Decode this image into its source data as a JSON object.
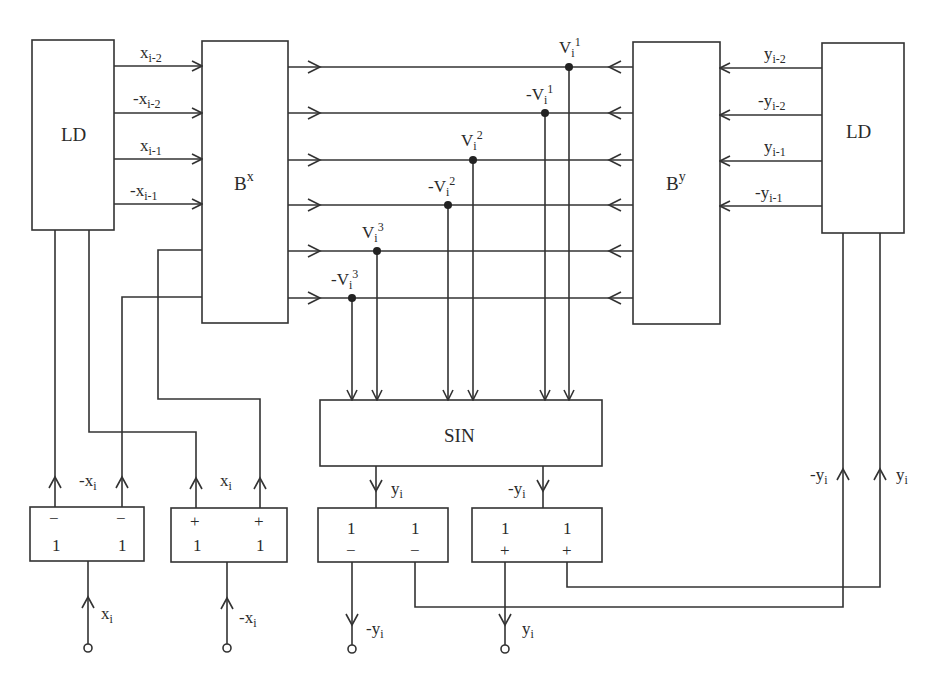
{
  "diagram": {
    "blocks": {
      "ld_left": "LD",
      "ld_right": "LD",
      "bx_base": "B",
      "bx_sup": "x",
      "by_base": "B",
      "by_sup": "y",
      "sin": "SIN"
    },
    "left_inputs": [
      {
        "sign": "",
        "var": "x",
        "sub": "i-2"
      },
      {
        "sign": "-",
        "var": "x",
        "sub": "i-2"
      },
      {
        "sign": "",
        "var": "x",
        "sub": "i-1"
      },
      {
        "sign": "-",
        "var": "x",
        "sub": "i-1"
      }
    ],
    "right_inputs": [
      {
        "sign": "",
        "var": "y",
        "sub": "i-2"
      },
      {
        "sign": "-",
        "var": "y",
        "sub": "i-2"
      },
      {
        "sign": "",
        "var": "y",
        "sub": "i-1"
      },
      {
        "sign": "-",
        "var": "y",
        "sub": "i-1"
      }
    ],
    "taps": [
      {
        "sign": "",
        "var": "V",
        "sub": "i",
        "sup": "1"
      },
      {
        "sign": "-",
        "var": "V",
        "sub": "i",
        "sup": "1"
      },
      {
        "sign": "",
        "var": "V",
        "sub": "i",
        "sup": "2"
      },
      {
        "sign": "-",
        "var": "V",
        "sub": "i",
        "sup": "2"
      },
      {
        "sign": "",
        "var": "V",
        "sub": "i",
        "sup": "3"
      },
      {
        "sign": "-",
        "var": "V",
        "sub": "i",
        "sup": "3"
      }
    ],
    "box1": {
      "top_left": "−",
      "top_right": "−",
      "bot_left": "1",
      "bot_right": "1"
    },
    "box2": {
      "top_left": "+",
      "top_right": "+",
      "bot_left": "1",
      "bot_right": "1"
    },
    "box3": {
      "top_left": "1",
      "top_right": "1",
      "bot_left": "−",
      "bot_right": "−"
    },
    "box4": {
      "top_left": "1",
      "top_right": "1",
      "bot_left": "+",
      "bot_right": "+"
    },
    "signal_labels": {
      "box1_out": {
        "sign": "-",
        "var": "x",
        "sub": "i"
      },
      "box2_out": {
        "sign": "",
        "var": "x",
        "sub": "i"
      },
      "box1_in": {
        "sign": "",
        "var": "x",
        "sub": "i"
      },
      "box2_in": {
        "sign": "-",
        "var": "x",
        "sub": "i"
      },
      "sin_out_left": {
        "sign": "",
        "var": "y",
        "sub": "i"
      },
      "sin_out_right": {
        "sign": "-",
        "var": "y",
        "sub": "i"
      },
      "box3_out": {
        "sign": "-",
        "var": "y",
        "sub": "i"
      },
      "box4_out": {
        "sign": "",
        "var": "y",
        "sub": "i"
      },
      "feedback_left": {
        "sign": "-",
        "var": "y",
        "sub": "i"
      },
      "feedback_right": {
        "sign": "",
        "var": "y",
        "sub": "i"
      }
    }
  }
}
